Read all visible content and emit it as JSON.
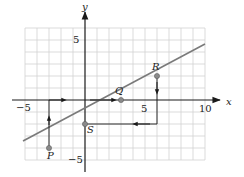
{
  "figure": {
    "axes": {
      "x_label": "x",
      "y_label": "y",
      "x_ticks": [
        {
          "value": -5,
          "label": "−5"
        },
        {
          "value": 5,
          "label": "5"
        },
        {
          "value": 10,
          "label": "10"
        }
      ],
      "y_ticks": [
        {
          "value": 5,
          "label": "5"
        },
        {
          "value": -5,
          "label": "−5"
        }
      ]
    },
    "points": {
      "P": {
        "label": "P",
        "x": -3,
        "y": -4
      },
      "S": {
        "label": "S",
        "x": 0,
        "y": -2
      },
      "Q": {
        "label": "Q",
        "x": 3,
        "y": 0
      },
      "R": {
        "label": "R",
        "x": 6,
        "y": 2
      }
    },
    "line": {
      "description": "line through P, S, Q, R with slope 2/3",
      "color": "#777777"
    },
    "colors": {
      "grid": "#cfcfcf",
      "axis": "#1a1a1a",
      "line": "#7a7a7a",
      "point": "#8a8a8a"
    }
  }
}
